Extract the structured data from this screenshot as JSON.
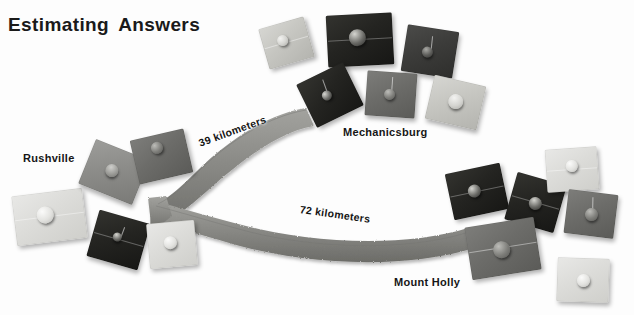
{
  "page": {
    "title_words": [
      "Estimating",
      "Answers"
    ],
    "background_color": "#ffffff",
    "width": 634,
    "height": 315
  },
  "map": {
    "places": [
      {
        "id": "rushville",
        "label": "Rushville",
        "x": 23,
        "y": 152
      },
      {
        "id": "mechanicsburg",
        "label": "Mechanicsburg",
        "x": 343,
        "y": 126
      },
      {
        "id": "mountholly",
        "label": "Mount Holly",
        "x": 394,
        "y": 276
      }
    ],
    "roads": [
      {
        "id": "road-39",
        "label": "39 kilometers",
        "from": "rushville",
        "to": "mechanicsburg",
        "distance": 39,
        "unit": "kilometers"
      },
      {
        "id": "road-72",
        "label": "72 kilometers",
        "from": "rushville",
        "to": "mountholly",
        "distance": 72,
        "unit": "kilometers"
      }
    ],
    "road_color": "#8d8d89",
    "road_edge_color": "#6e6e6a"
  },
  "tiles": [
    {
      "id": "t01",
      "cluster": "rushville",
      "tone": "t-vlight",
      "x": 14,
      "y": 192,
      "w": 71,
      "h": 50,
      "rot": -7,
      "peg": {
        "x": 44,
        "y": 45,
        "d": 17
      },
      "seam": true,
      "stem": null
    },
    {
      "id": "t02",
      "cluster": "rushville",
      "tone": "t-mid",
      "x": 85,
      "y": 148,
      "w": 58,
      "h": 48,
      "rot": 22,
      "peg": {
        "x": 46,
        "y": 48,
        "d": 13
      },
      "seam": false,
      "stem": null
    },
    {
      "id": "t03",
      "cluster": "rushville",
      "tone": "t-midd",
      "x": 134,
      "y": 134,
      "w": 55,
      "h": 45,
      "rot": -13,
      "peg": {
        "x": 46,
        "y": 28,
        "d": 12
      },
      "seam": false,
      "stem": null
    },
    {
      "id": "t04",
      "cluster": "rushville",
      "tone": "t-vdark",
      "x": 92,
      "y": 216,
      "w": 53,
      "h": 48,
      "rot": 16,
      "peg": {
        "x": 47,
        "y": 45,
        "d": 9
      },
      "seam": true,
      "stem": {
        "x": 52,
        "y": 20,
        "h": 22,
        "rot": 4
      }
    },
    {
      "id": "t05",
      "cluster": "rushville",
      "tone": "t-vlight",
      "x": 148,
      "y": 222,
      "w": 48,
      "h": 45,
      "rot": -5,
      "peg": {
        "x": 47,
        "y": 45,
        "d": 13
      },
      "seam": false,
      "stem": null
    },
    {
      "id": "t06",
      "cluster": "mechanicsburg",
      "tone": "t-light",
      "x": 263,
      "y": 22,
      "w": 47,
      "h": 42,
      "rot": -16,
      "peg": {
        "x": 44,
        "y": 42,
        "d": 11
      },
      "seam": true,
      "stem": null
    },
    {
      "id": "t07",
      "cluster": "mechanicsburg",
      "tone": "t-vdark",
      "x": 327,
      "y": 14,
      "w": 66,
      "h": 52,
      "rot": -3,
      "peg": {
        "x": 46,
        "y": 45,
        "d": 17
      },
      "seam": true,
      "stem": null
    },
    {
      "id": "t08",
      "cluster": "mechanicsburg",
      "tone": "t-dark",
      "x": 404,
      "y": 28,
      "w": 52,
      "h": 47,
      "rot": 9,
      "peg": {
        "x": 46,
        "y": 52,
        "d": 11
      },
      "seam": false,
      "stem": {
        "x": 50,
        "y": 16,
        "h": 28,
        "rot": -3
      }
    },
    {
      "id": "t09",
      "cluster": "mechanicsburg",
      "tone": "t-vdark",
      "x": 304,
      "y": 71,
      "w": 52,
      "h": 48,
      "rot": -26,
      "peg": {
        "x": 44,
        "y": 48,
        "d": 10
      },
      "seam": false,
      "stem": {
        "x": 48,
        "y": 14,
        "h": 26,
        "rot": 6
      }
    },
    {
      "id": "t10",
      "cluster": "mechanicsburg",
      "tone": "t-midd",
      "x": 366,
      "y": 72,
      "w": 50,
      "h": 45,
      "rot": 4,
      "peg": {
        "x": 46,
        "y": 50,
        "d": 11
      },
      "seam": false,
      "stem": {
        "x": 50,
        "y": 12,
        "h": 30,
        "rot": 0
      }
    },
    {
      "id": "t11",
      "cluster": "mechanicsburg",
      "tone": "t-light",
      "x": 429,
      "y": 80,
      "w": 53,
      "h": 45,
      "rot": 13,
      "peg": {
        "x": 50,
        "y": 48,
        "d": 15
      },
      "seam": false,
      "stem": null
    },
    {
      "id": "t12",
      "cluster": "mountholly",
      "tone": "t-vdark",
      "x": 449,
      "y": 168,
      "w": 56,
      "h": 47,
      "rot": -12,
      "peg": {
        "x": 46,
        "y": 48,
        "d": 13
      },
      "seam": true,
      "stem": null
    },
    {
      "id": "t13",
      "cluster": "mountholly",
      "tone": "t-vdark",
      "x": 510,
      "y": 178,
      "w": 51,
      "h": 49,
      "rot": 16,
      "peg": {
        "x": 50,
        "y": 52,
        "d": 13
      },
      "seam": true,
      "stem": null
    },
    {
      "id": "t14",
      "cluster": "mountholly",
      "tone": "t-vlight",
      "x": 546,
      "y": 148,
      "w": 52,
      "h": 43,
      "rot": -4,
      "peg": {
        "x": 50,
        "y": 42,
        "d": 12
      },
      "seam": true,
      "stem": null
    },
    {
      "id": "t15",
      "cluster": "mountholly",
      "tone": "t-midd",
      "x": 566,
      "y": 192,
      "w": 50,
      "h": 44,
      "rot": 7,
      "peg": {
        "x": 50,
        "y": 50,
        "d": 13
      },
      "seam": false,
      "stem": {
        "x": 50,
        "y": 12,
        "h": 28,
        "rot": -6
      }
    },
    {
      "id": "t16",
      "cluster": "mountholly",
      "tone": "t-midd",
      "x": 468,
      "y": 222,
      "w": 70,
      "h": 53,
      "rot": -9,
      "peg": {
        "x": 48,
        "y": 52,
        "d": 17
      },
      "seam": true,
      "stem": null
    },
    {
      "id": "t17",
      "cluster": "mountholly",
      "tone": "t-vlight",
      "x": 557,
      "y": 258,
      "w": 52,
      "h": 44,
      "rot": 2,
      "peg": {
        "x": 50,
        "y": 52,
        "d": 13
      },
      "seam": false,
      "stem": null
    }
  ]
}
